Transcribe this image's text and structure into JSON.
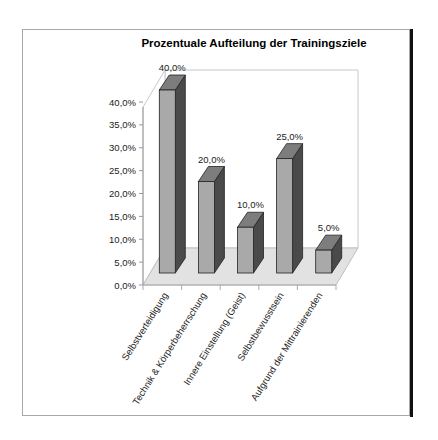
{
  "chart_data": {
    "type": "bar",
    "style": "3d-column",
    "title": "Prozentuale Aufteilung der Trainingsziele",
    "xlabel": "",
    "ylabel": "",
    "categories": [
      "Selbstverteidigung",
      "Technik & Körperbeherrschung",
      "Innere Einstellung (Geist)",
      "Selbstbewusstsein",
      "Aufgrund der Mittrainierenden"
    ],
    "values": [
      40.0,
      20.0,
      10.0,
      25.0,
      5.0
    ],
    "data_labels": [
      "40,0%",
      "20,0%",
      "10,0%",
      "25,0%",
      "5,0%"
    ],
    "ylim": [
      0,
      40
    ],
    "yticks": [
      "0,0%",
      "5,0%",
      "10,0%",
      "15,0%",
      "20,0%",
      "25,0%",
      "30,0%",
      "35,0%",
      "40,0%"
    ],
    "grid": false,
    "legend": "none",
    "colors": {
      "bar_front": "#a9a9a9",
      "bar_top": "#7d7d7d",
      "bar_side": "#4a4a4a",
      "floor": "#e2e2e2",
      "wall": "#ffffff"
    }
  }
}
